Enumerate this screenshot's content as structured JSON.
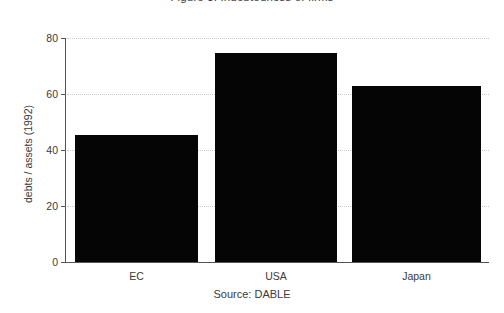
{
  "chart_data": {
    "type": "bar",
    "title": "Figure 3: Indebtedness of firms",
    "xlabel": "",
    "ylabel": "debts / assets (1992)",
    "categories": [
      "EC",
      "USA",
      "Japan"
    ],
    "values": [
      45.5,
      74.5,
      63
    ],
    "series": [
      {
        "name": "debts / assets (1992)",
        "values": [
          45.5,
          74.5,
          63
        ]
      }
    ],
    "ylim": [
      0,
      80
    ],
    "yticks": [
      0,
      20,
      40,
      60,
      80
    ],
    "ytick_labels": [
      "0",
      "20",
      "40",
      "60",
      "80"
    ],
    "grid": true,
    "grid_axis": "y",
    "grid_style": "dotted",
    "legend": false,
    "legend_position": "none",
    "bar_color": "#050505",
    "axis_color": "#555555",
    "grid_color": "#c9c9c9",
    "text_color": "#3a3a3a",
    "background": "#ffffff",
    "annotations": [
      {
        "text": "Source: DABLE",
        "position": "below-axis-center"
      }
    ]
  },
  "caption": {
    "source_text": "Source: DABLE"
  }
}
